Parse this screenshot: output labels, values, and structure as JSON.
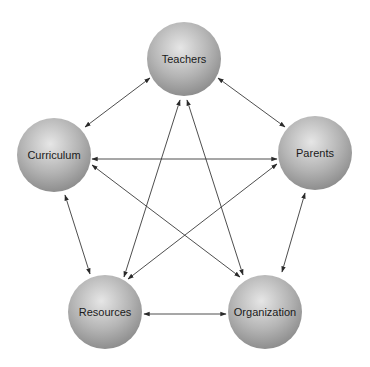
{
  "diagram": {
    "title": "",
    "node_radius": 37,
    "colors": {
      "sphere_highlight": "#e6e6e6",
      "sphere_mid": "#b4b4b4",
      "sphere_edge": "#8e8e8e",
      "edge": "#3a3a3a",
      "label": "#1a1a1a",
      "background": "#ffffff"
    },
    "nodes": [
      {
        "id": "teachers",
        "label": "Teachers",
        "cx": 184,
        "cy": 59
      },
      {
        "id": "curriculum",
        "label": "Curriculum",
        "cx": 54,
        "cy": 155
      },
      {
        "id": "parents",
        "label": "Parents",
        "cx": 315,
        "cy": 153
      },
      {
        "id": "resources",
        "label": "Resources",
        "cx": 105,
        "cy": 312
      },
      {
        "id": "organization",
        "label": "Organization",
        "cx": 265,
        "cy": 312
      }
    ],
    "edges": [
      {
        "from": "curriculum",
        "to": "teachers",
        "x1": 85,
        "y1": 127,
        "x2": 150,
        "y2": 78,
        "bidirectional": true
      },
      {
        "from": "teachers",
        "to": "parents",
        "x1": 218,
        "y1": 78,
        "x2": 285,
        "y2": 127,
        "bidirectional": true
      },
      {
        "from": "curriculum",
        "to": "parents",
        "x1": 92,
        "y1": 159,
        "x2": 277,
        "y2": 159,
        "bidirectional": true
      },
      {
        "from": "curriculum",
        "to": "organization",
        "x1": 92,
        "y1": 165,
        "x2": 240,
        "y2": 277,
        "bidirectional": true
      },
      {
        "from": "parents",
        "to": "resources",
        "x1": 277,
        "y1": 164,
        "x2": 128,
        "y2": 279,
        "bidirectional": true
      },
      {
        "from": "teachers",
        "to": "resources",
        "x1": 180,
        "y1": 100,
        "x2": 124,
        "y2": 277,
        "bidirectional": true
      },
      {
        "from": "teachers",
        "to": "organization",
        "x1": 187,
        "y1": 100,
        "x2": 243,
        "y2": 275,
        "bidirectional": true
      },
      {
        "from": "curriculum",
        "to": "resources",
        "x1": 65,
        "y1": 195,
        "x2": 90,
        "y2": 274,
        "bidirectional": true
      },
      {
        "from": "parents",
        "to": "organization",
        "x1": 305,
        "y1": 193,
        "x2": 282,
        "y2": 272,
        "bidirectional": true
      },
      {
        "from": "resources",
        "to": "organization",
        "x1": 144,
        "y1": 314,
        "x2": 226,
        "y2": 314,
        "bidirectional": true
      }
    ]
  }
}
